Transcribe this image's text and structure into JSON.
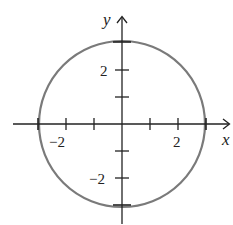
{
  "diagram": {
    "type": "coordinate-plane",
    "axes": {
      "x_label": "x",
      "y_label": "y"
    },
    "x_tick_labels": [
      {
        "value": -2,
        "text": "−2"
      },
      {
        "value": 2,
        "text": "2"
      }
    ],
    "y_tick_labels": [
      {
        "value": 2,
        "text": "2"
      },
      {
        "value": -2,
        "text": "−2"
      }
    ],
    "x_ticks": [
      -3,
      -2,
      -1,
      1,
      2,
      3
    ],
    "y_ticks": [
      -3,
      -2,
      -1,
      1,
      2,
      3
    ],
    "circle": {
      "center": [
        0,
        0
      ],
      "radius": 3,
      "equation": "x^2 + y^2 = 9",
      "stroke_color": "#7a7a7a"
    },
    "axis_color": "#222222"
  }
}
